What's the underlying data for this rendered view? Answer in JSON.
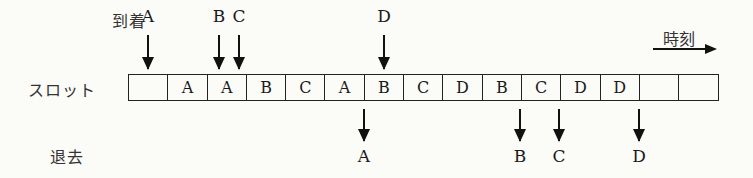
{
  "labels": {
    "arrival": "到着",
    "slot": "スロット",
    "departure": "退去",
    "time": "時刻"
  },
  "slots": [
    "",
    "A",
    "A",
    "B",
    "C",
    "A",
    "B",
    "C",
    "D",
    "B",
    "C",
    "D",
    "D",
    "",
    ""
  ],
  "arrivals": [
    {
      "label": "A",
      "x": 148
    },
    {
      "label": "B",
      "x": 219
    },
    {
      "label": "C",
      "x": 239
    },
    {
      "label": "D",
      "x": 384
    }
  ],
  "departures": [
    {
      "label": "A",
      "x": 364
    },
    {
      "label": "B",
      "x": 520
    },
    {
      "label": "C",
      "x": 559
    },
    {
      "label": "D",
      "x": 639
    }
  ]
}
